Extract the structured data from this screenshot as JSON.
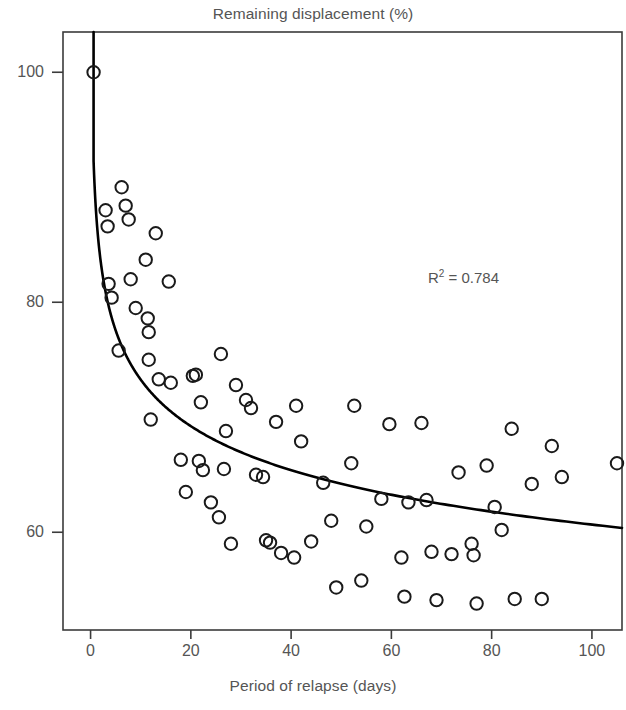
{
  "chart_data": {
    "type": "scatter",
    "title": "Remaining displacement (%)",
    "xlabel": "Period of relapse (days)",
    "ylabel": "",
    "xlim": [
      -5.5,
      106
    ],
    "ylim": [
      51.5,
      103.5
    ],
    "xticks": [
      0,
      20,
      40,
      60,
      80,
      100
    ],
    "xtick_labels": [
      "0",
      "20",
      "40",
      "60",
      "80",
      "100"
    ],
    "yticks": [
      60,
      80,
      100
    ],
    "ytick_labels": [
      "60",
      "80",
      "100"
    ],
    "grid": false,
    "legend": null,
    "marker": "open-circle",
    "annotations": [
      {
        "text": "R² = 0.784",
        "base": "R",
        "exponent": "2",
        "rest": " = 0.784",
        "x": 72,
        "y": 80.6
      }
    ],
    "fit_curve": {
      "type": "power",
      "label": "regression curve",
      "equation_form": "y = a * x^b",
      "a": 88.5,
      "b": -0.082,
      "r_squared": 0.784,
      "x_start": 0.6,
      "x_end": 106
    },
    "points": [
      {
        "x": 0.6,
        "y": 100.0
      },
      {
        "x": 3.0,
        "y": 88.0
      },
      {
        "x": 3.4,
        "y": 86.6
      },
      {
        "x": 3.6,
        "y": 81.6
      },
      {
        "x": 4.2,
        "y": 80.4
      },
      {
        "x": 5.6,
        "y": 75.8
      },
      {
        "x": 6.2,
        "y": 90.0
      },
      {
        "x": 7.0,
        "y": 88.4
      },
      {
        "x": 7.6,
        "y": 87.2
      },
      {
        "x": 8.0,
        "y": 82.0
      },
      {
        "x": 9.0,
        "y": 79.5
      },
      {
        "x": 11.0,
        "y": 83.7
      },
      {
        "x": 11.4,
        "y": 78.6
      },
      {
        "x": 11.6,
        "y": 77.4
      },
      {
        "x": 11.6,
        "y": 75.0
      },
      {
        "x": 12.0,
        "y": 69.8
      },
      {
        "x": 13.0,
        "y": 86.0
      },
      {
        "x": 13.6,
        "y": 73.3
      },
      {
        "x": 15.6,
        "y": 81.8
      },
      {
        "x": 16.0,
        "y": 73.0
      },
      {
        "x": 18.0,
        "y": 66.3
      },
      {
        "x": 19.0,
        "y": 63.5
      },
      {
        "x": 20.4,
        "y": 73.6
      },
      {
        "x": 21.0,
        "y": 73.7
      },
      {
        "x": 21.6,
        "y": 66.2
      },
      {
        "x": 22.0,
        "y": 71.3
      },
      {
        "x": 22.4,
        "y": 65.4
      },
      {
        "x": 24.0,
        "y": 62.6
      },
      {
        "x": 25.6,
        "y": 61.3
      },
      {
        "x": 26.0,
        "y": 75.5
      },
      {
        "x": 26.6,
        "y": 65.5
      },
      {
        "x": 27.0,
        "y": 68.8
      },
      {
        "x": 28.0,
        "y": 59.0
      },
      {
        "x": 29.0,
        "y": 72.8
      },
      {
        "x": 31.0,
        "y": 71.5
      },
      {
        "x": 32.0,
        "y": 70.8
      },
      {
        "x": 33.0,
        "y": 65.0
      },
      {
        "x": 34.4,
        "y": 64.8
      },
      {
        "x": 35.0,
        "y": 59.3
      },
      {
        "x": 35.8,
        "y": 59.1
      },
      {
        "x": 37.0,
        "y": 69.6
      },
      {
        "x": 38.0,
        "y": 58.2
      },
      {
        "x": 40.6,
        "y": 57.8
      },
      {
        "x": 41.0,
        "y": 71.0
      },
      {
        "x": 42.0,
        "y": 67.9
      },
      {
        "x": 44.0,
        "y": 59.2
      },
      {
        "x": 46.4,
        "y": 64.3
      },
      {
        "x": 48.0,
        "y": 61.0
      },
      {
        "x": 49.0,
        "y": 55.2
      },
      {
        "x": 52.0,
        "y": 66.0
      },
      {
        "x": 52.6,
        "y": 71.0
      },
      {
        "x": 54.0,
        "y": 55.8
      },
      {
        "x": 55.0,
        "y": 60.5
      },
      {
        "x": 58.0,
        "y": 62.9
      },
      {
        "x": 59.6,
        "y": 69.4
      },
      {
        "x": 62.0,
        "y": 57.8
      },
      {
        "x": 62.6,
        "y": 54.4
      },
      {
        "x": 63.4,
        "y": 62.6
      },
      {
        "x": 66.0,
        "y": 69.5
      },
      {
        "x": 67.0,
        "y": 62.8
      },
      {
        "x": 68.0,
        "y": 58.3
      },
      {
        "x": 69.0,
        "y": 54.1
      },
      {
        "x": 72.0,
        "y": 58.1
      },
      {
        "x": 73.4,
        "y": 65.2
      },
      {
        "x": 76.0,
        "y": 59.0
      },
      {
        "x": 76.4,
        "y": 58.0
      },
      {
        "x": 77.0,
        "y": 53.8
      },
      {
        "x": 79.0,
        "y": 65.8
      },
      {
        "x": 80.6,
        "y": 62.2
      },
      {
        "x": 82.0,
        "y": 60.2
      },
      {
        "x": 84.0,
        "y": 69.0
      },
      {
        "x": 84.6,
        "y": 54.2
      },
      {
        "x": 88.0,
        "y": 64.2
      },
      {
        "x": 90.0,
        "y": 54.2
      },
      {
        "x": 92.0,
        "y": 67.5
      },
      {
        "x": 94.0,
        "y": 64.8
      },
      {
        "x": 105.0,
        "y": 66.0
      }
    ]
  },
  "style": {
    "axis_color": "#3b3b3b",
    "text_color": "#555555",
    "marker_stroke": "#1a1a1a",
    "curve_color": "#000000",
    "background": "#ffffff"
  }
}
